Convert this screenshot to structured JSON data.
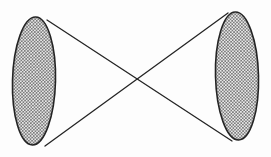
{
  "figure": {
    "description": "Bowtie / hourglass diagram: a left vertical hatched ellipse and a right vertical hatched ellipse connected by two straight lines that cross in the middle.",
    "background_color": "#fdfdfd",
    "stroke_color": "#242424",
    "hatch_color": "#4a4a4a",
    "hatch_fill_color": "#e9e9e9",
    "canvas": {
      "width": 271,
      "height": 157
    },
    "hatch": {
      "pattern_name": "diamond-mesh-hatch",
      "cell_size": 3.2,
      "line_width": 0.55
    },
    "shapes": [
      {
        "id": "left-ellipse",
        "name": "left-hatched-ellipse",
        "type": "ellipse",
        "cx": 34,
        "cy": 81,
        "rx": 21.5,
        "ry": 64,
        "rotation": 1.5,
        "stroke_width": 1.6,
        "fill": "hatch"
      },
      {
        "id": "right-ellipse",
        "name": "right-hatched-ellipse",
        "type": "ellipse",
        "cx": 237,
        "cy": 76,
        "rx": 21.5,
        "ry": 64,
        "rotation": -1.5,
        "stroke_width": 1.6,
        "fill": "hatch"
      }
    ],
    "connectors": [
      {
        "id": "connector-top-left-to-bottom-right",
        "name": "descending-connector-line",
        "type": "line",
        "x1": 47,
        "y1": 20,
        "x2": 232,
        "y2": 141,
        "stroke_width": 1.3
      },
      {
        "id": "connector-bottom-left-to-top-right",
        "name": "ascending-connector-line",
        "type": "line",
        "x1": 45,
        "y1": 146,
        "x2": 228,
        "y2": 13,
        "stroke_width": 1.3
      }
    ],
    "intersection": {
      "name": "crossing-point",
      "x": 136,
      "y": 79
    }
  }
}
